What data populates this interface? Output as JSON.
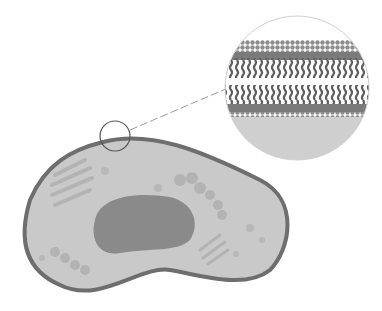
{
  "diagram": {
    "parts": [
      "cell",
      "cell-membrane",
      "cytoplasm",
      "nucleus",
      "golgi-apparatus",
      "endoplasmic-reticulum",
      "vesicles",
      "magnifier-circle",
      "zoom-callout",
      "phospholipid-bilayer"
    ],
    "colors": {
      "membrane": "#6e6e6e",
      "cytoplasm": "#c9c9c9",
      "nucleus": "#8a8a8a",
      "organelle": "#b3b3b3",
      "heads": "#8c8c8c",
      "tails": "#5e5e5e",
      "callout_line": "#9a9a9a"
    }
  }
}
